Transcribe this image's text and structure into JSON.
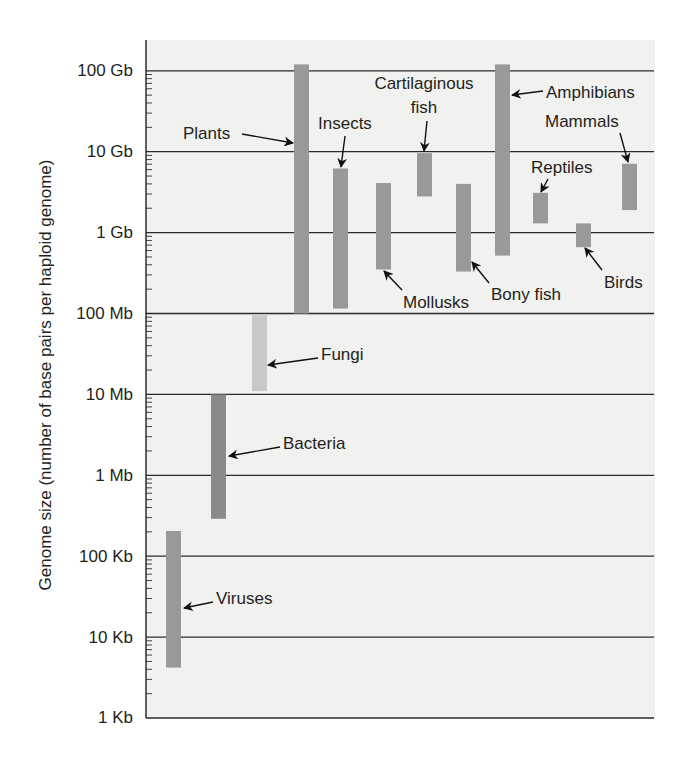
{
  "chart_data": {
    "type": "bar",
    "subtype": "floating-range-bar",
    "title": "",
    "xlabel": "",
    "ylabel": "Genome size (number of base pairs per haploid genome)",
    "yscale": "log10",
    "ylim": [
      1000,
      100000000000
    ],
    "yticks": [
      {
        "value": 1000,
        "label": "1 Kb"
      },
      {
        "value": 10000,
        "label": "10 Kb"
      },
      {
        "value": 100000,
        "label": "100 Kb"
      },
      {
        "value": 1000000,
        "label": "1 Mb"
      },
      {
        "value": 10000000,
        "label": "10 Mb"
      },
      {
        "value": 100000000,
        "label": "100 Mb"
      },
      {
        "value": 1000000000,
        "label": "1 Gb"
      },
      {
        "value": 10000000000,
        "label": "10 Gb"
      },
      {
        "value": 100000000000,
        "label": "100 Gb"
      }
    ],
    "grid": true,
    "legend": "none (direct labels with arrows)",
    "categories": [
      "Viruses",
      "Bacteria",
      "Fungi",
      "Plants",
      "Insects",
      "Mollusks",
      "Cartilaginous fish",
      "Bony fish",
      "Amphibians",
      "Reptiles",
      "Birds",
      "Mammals"
    ],
    "series": [
      {
        "name": "min_bp",
        "values": [
          4200,
          290000,
          11000000,
          100000000,
          115000000,
          350000000,
          2800000000,
          330000000,
          520000000,
          1300000000,
          660000000,
          1900000000
        ]
      },
      {
        "name": "max_bp",
        "values": [
          205000,
          10000000,
          95000000,
          120000000000,
          6200000000,
          4100000000,
          9600000000,
          4000000000,
          120000000000,
          3100000000,
          1300000000,
          7100000000
        ]
      }
    ]
  },
  "bars": [
    {
      "name": "Viruses",
      "label": "Viruses",
      "x": 166,
      "min": 4200,
      "max": 205000,
      "color": "#999999",
      "label_x": 216,
      "label_y": 604,
      "label_lines": [
        "Viruses"
      ],
      "arrow": [
        [
          213,
          602
        ],
        [
          184,
          608
        ]
      ]
    },
    {
      "name": "Bacteria",
      "label": "Bacteria",
      "x": 211,
      "min": 290000,
      "max": 10000000,
      "color": "#8a8a8a",
      "label_x": 283,
      "label_y": 449,
      "label_lines": [
        "Bacteria"
      ],
      "arrow": [
        [
          280,
          447
        ],
        [
          229,
          456
        ]
      ]
    },
    {
      "name": "Fungi",
      "label": "Fungi",
      "x": 252,
      "min": 11000000,
      "max": 95000000,
      "color": "#c8c8c8",
      "label_x": 321,
      "label_y": 360,
      "label_lines": [
        "Fungi"
      ],
      "arrow": [
        [
          318,
          358
        ],
        [
          268,
          365
        ]
      ]
    },
    {
      "name": "Plants",
      "label": "Plants",
      "x": 294,
      "min": 100000000,
      "max": 120000000000,
      "color": "#999999",
      "label_x": 183,
      "label_y": 139,
      "label_lines": [
        "Plants"
      ],
      "arrow": [
        [
          242,
          134
        ],
        [
          293,
          143
        ]
      ]
    },
    {
      "name": "Insects",
      "label": "Insects",
      "x": 333,
      "min": 115000000,
      "max": 6200000000,
      "color": "#999999",
      "label_x": 318,
      "label_y": 129,
      "label_lines": [
        "Insects"
      ],
      "arrow": [
        [
          345,
          136
        ],
        [
          341,
          167
        ]
      ]
    },
    {
      "name": "Mollusks",
      "label": "Mollusks",
      "x": 376,
      "min": 350000000,
      "max": 4100000000,
      "color": "#999999",
      "label_x": 403,
      "label_y": 308,
      "label_lines": [
        "Mollusks"
      ],
      "arrow": [
        [
          402,
          290
        ],
        [
          384,
          271
        ]
      ]
    },
    {
      "name": "Cartilaginous fish",
      "label": "Cartilaginous fish",
      "x": 417,
      "min": 2800000000,
      "max": 9600000000,
      "color": "#999999",
      "label_x": 424,
      "label_y": 89,
      "label_lines": [
        "Cartilaginous",
        "fish"
      ],
      "arrow": [
        [
          427,
          121
        ],
        [
          424,
          151
        ]
      ]
    },
    {
      "name": "Bony fish",
      "label": "Bony fish",
      "x": 456,
      "min": 330000000,
      "max": 4000000000,
      "color": "#999999",
      "label_x": 491,
      "label_y": 300,
      "label_lines": [
        "Bony fish"
      ],
      "arrow": [
        [
          489,
          283
        ],
        [
          472,
          262
        ]
      ]
    },
    {
      "name": "Amphibians",
      "label": "Amphibians",
      "x": 495,
      "min": 520000000,
      "max": 120000000000,
      "color": "#999999",
      "label_x": 546,
      "label_y": 98,
      "label_lines": [
        "Amphibians"
      ],
      "arrow": [
        [
          543,
          91
        ],
        [
          512,
          95
        ]
      ]
    },
    {
      "name": "Reptiles",
      "label": "Reptiles",
      "x": 533,
      "min": 1300000000,
      "max": 3100000000,
      "color": "#999999",
      "label_x": 531,
      "label_y": 173,
      "label_lines": [
        "Reptiles"
      ],
      "arrow": [
        [
          548,
          179
        ],
        [
          541,
          192
        ]
      ]
    },
    {
      "name": "Birds",
      "label": "Birds",
      "x": 576,
      "min": 660000000,
      "max": 1300000000,
      "color": "#999999",
      "label_x": 604,
      "label_y": 288,
      "label_lines": [
        "Birds"
      ],
      "arrow": [
        [
          602,
          270
        ],
        [
          585,
          248
        ]
      ]
    },
    {
      "name": "Mammals",
      "label": "Mammals",
      "x": 622,
      "min": 1900000000,
      "max": 7100000000,
      "color": "#999999",
      "label_x": 545,
      "label_y": 127,
      "label_lines": [
        "Mammals"
      ],
      "arrow": [
        [
          620,
          133
        ],
        [
          628,
          162
        ]
      ]
    }
  ],
  "layout": {
    "plot_left": 146,
    "plot_right": 654,
    "plot_top": 40,
    "axis_bottom": 718,
    "y_1kb": 718,
    "px_per_decade": 80.9,
    "bar_width": 15,
    "plot_bg": "#f1f1f0"
  }
}
